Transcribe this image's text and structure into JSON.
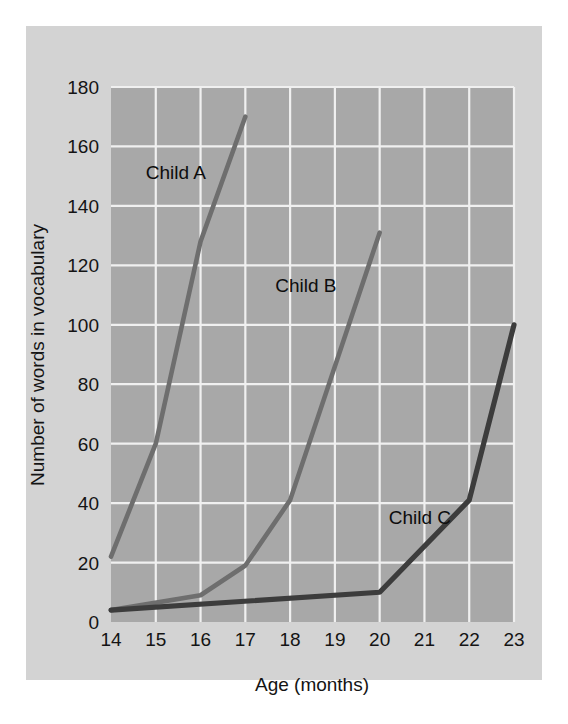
{
  "figure": {
    "background_color": "#d3d3d3",
    "plot_background_color": "#a8a8a8",
    "gridline_color": "#f0f0f0",
    "page_background_color": "#ffffff"
  },
  "chart_data": {
    "type": "line",
    "title": "",
    "xlabel": "Age (months)",
    "ylabel": "Number of words in vocabulary",
    "xlim": [
      14,
      23
    ],
    "ylim": [
      0,
      180
    ],
    "xticks": [
      "14",
      "15",
      "16",
      "17",
      "18",
      "19",
      "20",
      "21",
      "22",
      "23"
    ],
    "yticks": [
      "0",
      "20",
      "40",
      "60",
      "80",
      "100",
      "120",
      "140",
      "160",
      "180"
    ],
    "grid": true,
    "legend": "inline-annotations",
    "series": [
      {
        "name": "Child A",
        "color": "#6e6e6e",
        "label_x": 15.45,
        "label_y": 151,
        "x": [
          14,
          15,
          16,
          17
        ],
        "values": [
          22,
          60,
          128,
          170
        ]
      },
      {
        "name": "Child B",
        "color": "#6e6e6e",
        "label_x": 18.35,
        "label_y": 113,
        "x": [
          14,
          16,
          17,
          18,
          20
        ],
        "values": [
          4,
          9,
          19,
          41,
          131
        ]
      },
      {
        "name": "Child C",
        "color": "#3c3c3c",
        "label_x": 20.9,
        "label_y": 35,
        "x": [
          14,
          20,
          22,
          23
        ],
        "values": [
          4,
          10,
          41,
          100
        ]
      }
    ]
  }
}
